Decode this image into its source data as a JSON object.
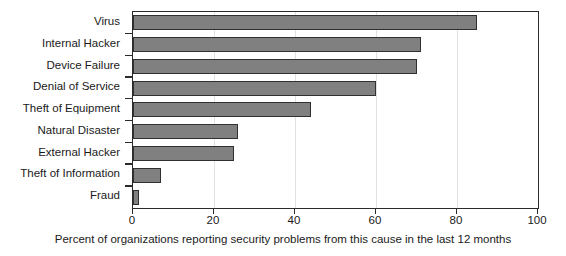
{
  "chart_data": {
    "type": "bar",
    "orientation": "horizontal",
    "title": "",
    "categories": [
      "Virus",
      "Internal Hacker",
      "Device Failure",
      "Denial of Service",
      "Theft of Equipment",
      "Natural Disaster",
      "External Hacker",
      "Theft of Information",
      "Fraud"
    ],
    "values": [
      85,
      71,
      70,
      60,
      44,
      26,
      25,
      7,
      1.5
    ],
    "xlabel": "Percent of organizations reporting security problems from this cause in the last 12 months",
    "ylabel": "",
    "xlim": [
      0,
      100
    ],
    "xticks": [
      0,
      20,
      40,
      60,
      80,
      100
    ],
    "xtick_labels": [
      "0",
      "20",
      "40",
      "60",
      "80",
      "100"
    ],
    "grid": "vertical",
    "legend": "none",
    "colors": {
      "bar_fill": "#808080",
      "bar_border": "#303030",
      "axis": "#2b2b2b",
      "gridline": "#e2e2e2",
      "text": "#1a1a1a",
      "background": "#ffffff"
    }
  }
}
